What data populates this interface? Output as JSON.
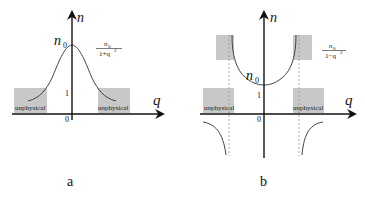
{
  "panels": {
    "a": {
      "label": "a",
      "y_axis_label": "n",
      "x_axis_label": "q",
      "peak_label": "n",
      "peak_label_sub": "0",
      "tick_one": "1",
      "origin": "0",
      "formula": {
        "numerator": "n",
        "numerator_sub": "0",
        "denominator": "1+q",
        "denominator_sup": "2"
      },
      "regions": [
        "unphysical",
        "unphysical"
      ]
    },
    "b": {
      "label": "b",
      "y_axis_label": "n",
      "x_axis_label": "q",
      "min_label": "n",
      "min_label_sub": "0",
      "tick_one": "1",
      "origin": "0",
      "formula": {
        "numerator": "n",
        "numerator_sub": "0",
        "denominator": "1−q",
        "denominator_sup": "2"
      },
      "regions": [
        "unphysical",
        "unphysical"
      ]
    }
  },
  "colors": {
    "axis": "#111111",
    "curve": "#444444",
    "region": "#c8c8c8",
    "dashed": "#888888"
  }
}
